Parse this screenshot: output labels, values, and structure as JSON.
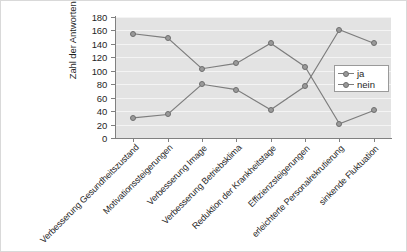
{
  "chart_data": {
    "type": "line",
    "title": "",
    "xlabel": "",
    "ylabel": "Zahl der Antworten von 185",
    "ylim": [
      0,
      180
    ],
    "ytick_step": 20,
    "yticks": [
      0,
      20,
      40,
      60,
      80,
      100,
      120,
      140,
      160,
      180
    ],
    "grid": true,
    "grid_orientation": "horizontal",
    "legend_position": "right",
    "categories": [
      "Verbesserung Gesundheitszustand",
      "Motivationssteigerungen",
      "Verbesserung Image",
      "Verbesserung Betriebsklima",
      "Reduktion der Krankheitstage",
      "Effizienzsteigerungen",
      "erleichterte Personalrekrutierung",
      "sinkende Fluktuation"
    ],
    "series": [
      {
        "name": "ja",
        "values": [
          155,
          149,
          103,
          111,
          141,
          106,
          21,
          41
        ],
        "color": "#9a9a9a",
        "marker": "circle"
      },
      {
        "name": "nein",
        "values": [
          30,
          35,
          80,
          72,
          42,
          77,
          161,
          141
        ],
        "color": "#9a9a9a",
        "marker": "circle"
      }
    ]
  },
  "legend": {
    "entries": [
      "ja",
      "nein"
    ]
  },
  "colors": {
    "plot_background": "#e3e3e3",
    "gridline": "#f4f4f4",
    "axis": "#808080",
    "series": "#9a9a9a",
    "line": "#7d7d7d",
    "text": "#1f1f1f",
    "frame": "#d9d9d9",
    "page_background": "#ffffff"
  }
}
